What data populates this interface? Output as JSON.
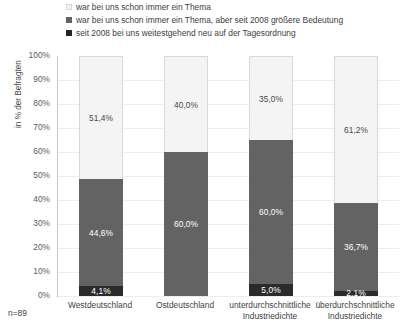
{
  "chart_data": {
    "type": "bar",
    "subtype": "stacked-100-percent",
    "title": "",
    "xlabel": "",
    "ylabel": "in % der Befragten",
    "ylim": [
      0,
      100
    ],
    "grid": true,
    "legend_position": "top",
    "note": "n=89",
    "categories": [
      "Westdeutschland",
      "Ostdeutschland",
      "unterdurchschnittliche Industriedichte",
      "überdurchschnittliche Industriedichte"
    ],
    "series": [
      {
        "name": "war bei uns schon immer ein Thema",
        "color": "#f4f4f4",
        "values": [
          51.4,
          40.0,
          35.0,
          61.2
        ],
        "labels": [
          "51,4%",
          "40,0%",
          "35,0%",
          "61,2%"
        ]
      },
      {
        "name": "war bei uns schon immer ein Thema, aber seit 2008 größere Bedeutung",
        "color": "#636363",
        "values": [
          44.6,
          60.0,
          60.0,
          36.7
        ],
        "labels": [
          "44,6%",
          "60,0%",
          "60,0%",
          "36,7%"
        ]
      },
      {
        "name": "seit 2008 bei uns weitestgehend neu auf der Tagesordnung",
        "color": "#2b2b2b",
        "values": [
          4.1,
          0.0,
          5.0,
          2.1
        ],
        "labels": [
          "4,1%",
          "",
          "5,0%",
          "2,1%"
        ]
      }
    ],
    "yticks": [
      "100%",
      "90%",
      "80%",
      "70%",
      "60%",
      "50%",
      "40%",
      "30%",
      "20%",
      "10%",
      "0%"
    ]
  },
  "legend": {
    "items": [
      {
        "label": "war bei uns schon immer ein Thema",
        "swatch": "legend-swatch-light"
      },
      {
        "label": "war bei uns schon immer ein Thema, aber seit 2008 größere Bedeutung",
        "swatch": "legend-swatch-medium"
      },
      {
        "label": "seit 2008 bei uns weitestgehend neu auf der Tagesordnung",
        "swatch": "legend-swatch-dark"
      }
    ]
  },
  "axes": {
    "y_title": "in % der Befragten",
    "y_ticks": [
      "100%",
      "90%",
      "80%",
      "70%",
      "60%",
      "50%",
      "40%",
      "30%",
      "20%",
      "10%",
      "0%"
    ],
    "x_categories": [
      {
        "line1": "Westdeutschland",
        "line2": ""
      },
      {
        "line1": "Ostdeutschland",
        "line2": ""
      },
      {
        "line1": "unterdurchschnittliche",
        "line2": "Industriedichte"
      },
      {
        "line1": "überdurchschnittliche",
        "line2": "Industriedichte"
      }
    ]
  },
  "footnote": {
    "sample": "n=89"
  }
}
